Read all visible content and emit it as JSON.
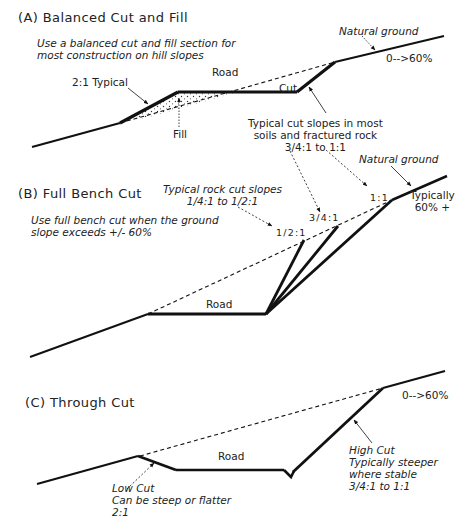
{
  "colors": {
    "line": "#111111",
    "text": "#222222",
    "background": "#ffffff"
  },
  "panel_a": {
    "title": "(A) Balanced Cut and Fill",
    "note_line1": "Use a balanced cut and fill section for",
    "note_line2": "most construction on  hill slopes",
    "natural_ground": "Natural ground",
    "slope_range": "0-->60%",
    "fill_slope": "2:1 Typical",
    "road": "Road",
    "cut": "Cut",
    "fill": "Fill",
    "cut_note_line1": "Typical cut slopes in most",
    "cut_note_line2": "soils and fractured rock",
    "cut_note_line3": "3/4:1 to 1:1"
  },
  "panel_b": {
    "title": "(B) Full Bench Cut",
    "note_line1": "Use full bench cut when the ground",
    "note_line2": "slope exceeds +/- 60%",
    "rock_note_line1": "Typical rock cut slopes",
    "rock_note_line2": "1/4:1 to 1/2:1",
    "natural_ground": "Natural ground",
    "ratio_half": "1/2:1",
    "ratio_three_quarter": "3/4:1",
    "ratio_one": "1:1",
    "typically_line1": "Typically",
    "typically_line2": "60% +",
    "road": "Road"
  },
  "panel_c": {
    "title": "(C) Through Cut",
    "slope_range": "0-->60%",
    "road": "Road",
    "low_cut_line1": "Low Cut",
    "low_cut_line2": "Can be steep or flatter",
    "low_cut_line3": "2:1",
    "high_cut_line1": "High Cut",
    "high_cut_line2": "Typically steeper",
    "high_cut_line3": "where stable",
    "high_cut_line4": "3/4:1 to 1:1"
  }
}
